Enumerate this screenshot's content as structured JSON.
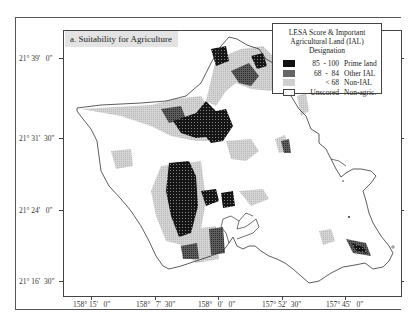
{
  "map": {
    "title": "a. Suitability for Agriculture",
    "region": "Oahu, Hawaii"
  },
  "legend": {
    "title_line1": "LESA Score & Important",
    "title_line2": "Agricultural Land (IAL) Designation",
    "items": [
      {
        "range": "85  - 100",
        "label": "Prime land",
        "color": "#111111"
      },
      {
        "range": "68  -  84",
        "label": "Other IAL",
        "color": "#666666"
      },
      {
        "range": "< 68",
        "label": "Non-IAL",
        "color": "#c8c8c8"
      },
      {
        "range": "Unscored",
        "label": "Non-agric.",
        "color": "#ffffff"
      }
    ]
  },
  "axes": {
    "latitude_ticks": [
      {
        "label": "21° 39'   0\"",
        "y": 58
      },
      {
        "label": "21° 31'  30\"",
        "y": 138
      },
      {
        "label": "21° 24'   0\"",
        "y": 210
      },
      {
        "label": "21° 16'  30\"",
        "y": 281
      }
    ],
    "longitude_ticks": [
      {
        "label": "158° 15'   0\"",
        "x": 91
      },
      {
        "label": "158°   7'  30\"",
        "x": 155
      },
      {
        "label": "158°   0'   0\"",
        "x": 218
      },
      {
        "label": "157° 52'  30\"",
        "x": 282
      },
      {
        "label": "157° 45'   0\"",
        "x": 345
      }
    ]
  },
  "colors": {
    "prime": "#111111",
    "other_ial": "#666666",
    "non_ial": "#c8c8c8",
    "coastline": "#333333",
    "title_bg": "#e3e3e3"
  }
}
